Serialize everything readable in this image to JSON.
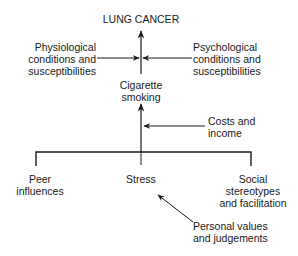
{
  "diagram": {
    "title": "LUNG CANCER",
    "nodes": {
      "lung_cancer": "LUNG CANCER",
      "physiological": "Physiological\nconditions and\nsusceptibilities",
      "psychological": "Psychological\nconditions and\nsusceptibilities",
      "cigarette_smoking": "Cigarette\nsmoking",
      "costs_income": "Costs and\nincome",
      "peer_influences": "Peer\ninfluences",
      "stress": "Stress",
      "social_stereotypes": "Social\nstereotypes\nand facilitation",
      "personal_values": "Personal values\nand judgements"
    },
    "edges": [
      {
        "from": "cigarette_smoking",
        "to": "lung_cancer"
      },
      {
        "from": "physiological",
        "to": "smoking_to_cancer_link"
      },
      {
        "from": "psychological",
        "to": "smoking_to_cancer_link"
      },
      {
        "from": "costs_income",
        "to": "factors_to_smoking_link"
      },
      {
        "from": "peer_influences",
        "to": "cigarette_smoking"
      },
      {
        "from": "stress",
        "to": "cigarette_smoking"
      },
      {
        "from": "social_stereotypes",
        "to": "cigarette_smoking"
      },
      {
        "from": "personal_values",
        "to": "stress"
      }
    ],
    "line_color": "#1a1a1a"
  }
}
